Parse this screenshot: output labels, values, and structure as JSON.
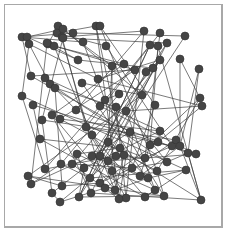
{
  "diagram": {
    "type": "network-graph",
    "frame": {
      "x": 4,
      "y": 4,
      "width": 218,
      "height": 222,
      "border_color": "#a8a8a8"
    },
    "colors": {
      "node": "#454545",
      "edge": "#3a3a3a",
      "background": "#ffffff"
    },
    "node_radius": 4,
    "nodes": [
      [
        22,
        37
      ],
      [
        27,
        37
      ],
      [
        29,
        44
      ],
      [
        58,
        26
      ],
      [
        57,
        33
      ],
      [
        63,
        29
      ],
      [
        62,
        37
      ],
      [
        73,
        33
      ],
      [
        63,
        38
      ],
      [
        48,
        44
      ],
      [
        54,
        46
      ],
      [
        47,
        43
      ],
      [
        96,
        26
      ],
      [
        100,
        26
      ],
      [
        83,
        42
      ],
      [
        106,
        46
      ],
      [
        144,
        31
      ],
      [
        160,
        33
      ],
      [
        185,
        36
      ],
      [
        150,
        45
      ],
      [
        158,
        46
      ],
      [
        167,
        43
      ],
      [
        180,
        59
      ],
      [
        199,
        69
      ],
      [
        78,
        60
      ],
      [
        31,
        76
      ],
      [
        45,
        78
      ],
      [
        50,
        84
      ],
      [
        55,
        88
      ],
      [
        82,
        83
      ],
      [
        98,
        79
      ],
      [
        112,
        66
      ],
      [
        124,
        64
      ],
      [
        135,
        70
      ],
      [
        146,
        72
      ],
      [
        153,
        68
      ],
      [
        142,
        95
      ],
      [
        155,
        105
      ],
      [
        200,
        98
      ],
      [
        202,
        106
      ],
      [
        22,
        96
      ],
      [
        33,
        105
      ],
      [
        42,
        120
      ],
      [
        52,
        115
      ],
      [
        40,
        139
      ],
      [
        60,
        119
      ],
      [
        76,
        110
      ],
      [
        86,
        127
      ],
      [
        105,
        100
      ],
      [
        100,
        106
      ],
      [
        119,
        94
      ],
      [
        116,
        107
      ],
      [
        92,
        135
      ],
      [
        108,
        142
      ],
      [
        120,
        148
      ],
      [
        124,
        155
      ],
      [
        130,
        132
      ],
      [
        150,
        145
      ],
      [
        172,
        146
      ],
      [
        176,
        140
      ],
      [
        188,
        153
      ],
      [
        196,
        154
      ],
      [
        160,
        131
      ],
      [
        158,
        142
      ],
      [
        28,
        176
      ],
      [
        31,
        184
      ],
      [
        45,
        169
      ],
      [
        61,
        164
      ],
      [
        62,
        186
      ],
      [
        52,
        193
      ],
      [
        60,
        202
      ],
      [
        72,
        164
      ],
      [
        77,
        154
      ],
      [
        92,
        156
      ],
      [
        100,
        156
      ],
      [
        108,
        161
      ],
      [
        116,
        156
      ],
      [
        84,
        168
      ],
      [
        90,
        178
      ],
      [
        100,
        183
      ],
      [
        112,
        171
      ],
      [
        132,
        168
      ],
      [
        140,
        176
      ],
      [
        148,
        178
      ],
      [
        155,
        190
      ],
      [
        164,
        196
      ],
      [
        180,
        146
      ],
      [
        186,
        170
      ],
      [
        167,
        162
      ],
      [
        145,
        158
      ],
      [
        126,
        198
      ],
      [
        119,
        199
      ],
      [
        105,
        188
      ],
      [
        91,
        193
      ],
      [
        79,
        197
      ],
      [
        201,
        200
      ],
      [
        157,
        171
      ],
      [
        126,
        111
      ],
      [
        160,
        60
      ],
      [
        115,
        190
      ],
      [
        145,
        197
      ]
    ],
    "edges": [
      [
        0,
        14
      ],
      [
        0,
        25
      ],
      [
        1,
        24
      ],
      [
        2,
        40
      ],
      [
        2,
        30
      ],
      [
        3,
        9
      ],
      [
        3,
        31
      ],
      [
        4,
        15
      ],
      [
        5,
        36
      ],
      [
        6,
        47
      ],
      [
        7,
        18
      ],
      [
        8,
        42
      ],
      [
        9,
        33
      ],
      [
        10,
        52
      ],
      [
        11,
        65
      ],
      [
        12,
        55
      ],
      [
        13,
        37
      ],
      [
        14,
        48
      ],
      [
        15,
        58
      ],
      [
        16,
        46
      ],
      [
        17,
        47
      ],
      [
        18,
        94
      ],
      [
        19,
        49
      ],
      [
        20,
        57
      ],
      [
        21,
        73
      ],
      [
        22,
        86
      ],
      [
        22,
        38
      ],
      [
        23,
        60
      ],
      [
        23,
        86
      ],
      [
        24,
        35
      ],
      [
        25,
        56
      ],
      [
        26,
        62
      ],
      [
        27,
        88
      ],
      [
        28,
        68
      ],
      [
        29,
        84
      ],
      [
        30,
        39
      ],
      [
        31,
        80
      ],
      [
        32,
        43
      ],
      [
        33,
        45
      ],
      [
        34,
        74
      ],
      [
        35,
        71
      ],
      [
        36,
        64
      ],
      [
        37,
        81
      ],
      [
        38,
        57
      ],
      [
        39,
        63
      ],
      [
        40,
        87
      ],
      [
        41,
        61
      ],
      [
        42,
        69
      ],
      [
        43,
        93
      ],
      [
        44,
        54
      ],
      [
        45,
        96
      ],
      [
        46,
        60
      ],
      [
        47,
        90
      ],
      [
        48,
        85
      ],
      [
        49,
        66
      ],
      [
        50,
        67
      ],
      [
        51,
        90
      ],
      [
        52,
        100
      ],
      [
        53,
        95
      ],
      [
        54,
        72
      ],
      [
        55,
        83
      ],
      [
        56,
        91
      ],
      [
        57,
        82
      ],
      [
        58,
        89
      ],
      [
        59,
        92
      ],
      [
        60,
        95
      ],
      [
        61,
        75
      ],
      [
        62,
        77
      ],
      [
        63,
        79
      ],
      [
        64,
        85
      ],
      [
        65,
        73
      ],
      [
        66,
        76
      ],
      [
        67,
        78
      ],
      [
        68,
        79
      ],
      [
        69,
        70
      ],
      [
        70,
        92
      ],
      [
        71,
        91
      ],
      [
        72,
        93
      ],
      [
        73,
        82
      ],
      [
        74,
        99
      ],
      [
        75,
        83
      ],
      [
        76,
        89
      ],
      [
        77,
        94
      ],
      [
        78,
        98
      ],
      [
        79,
        99
      ],
      [
        80,
        84
      ],
      [
        81,
        88
      ],
      [
        82,
        86
      ],
      [
        83,
        87
      ],
      [
        84,
        97
      ],
      [
        85,
        96
      ],
      [
        86,
        95
      ],
      [
        87,
        100
      ],
      [
        88,
        97
      ],
      [
        89,
        17
      ],
      [
        90,
        16
      ],
      [
        91,
        12
      ],
      [
        92,
        3
      ],
      [
        93,
        21
      ],
      [
        94,
        19
      ],
      [
        95,
        20
      ],
      [
        96,
        13
      ],
      [
        97,
        98
      ],
      [
        98,
        34
      ],
      [
        99,
        43
      ],
      [
        100,
        44
      ],
      [
        0,
        7
      ],
      [
        1,
        5
      ],
      [
        4,
        12
      ],
      [
        6,
        16
      ],
      [
        8,
        21
      ],
      [
        10,
        32
      ],
      [
        11,
        24
      ],
      [
        2,
        27
      ],
      [
        25,
        33
      ],
      [
        26,
        46
      ],
      [
        28,
        51
      ],
      [
        29,
        36
      ],
      [
        30,
        98
      ],
      [
        31,
        53
      ],
      [
        40,
        66
      ],
      [
        41,
        44
      ],
      [
        42,
        59
      ],
      [
        45,
        62
      ],
      [
        47,
        58
      ],
      [
        48,
        50
      ],
      [
        49,
        61
      ],
      [
        52,
        75
      ],
      [
        54,
        89
      ],
      [
        56,
        73
      ],
      [
        57,
        63
      ],
      [
        58,
        86
      ],
      [
        64,
        68
      ],
      [
        65,
        67
      ],
      [
        69,
        77
      ],
      [
        70,
        76
      ],
      [
        71,
        81
      ],
      [
        72,
        80
      ],
      [
        74,
        97
      ],
      [
        78,
        87
      ],
      [
        79,
        81
      ],
      [
        83,
        99
      ],
      [
        85,
        94
      ],
      [
        88,
        60
      ],
      [
        90,
        92
      ],
      [
        91,
        80
      ],
      [
        93,
        95
      ],
      [
        94,
        19
      ],
      [
        96,
        38
      ],
      [
        97,
        39
      ],
      [
        99,
        55
      ],
      [
        100,
        84
      ]
    ]
  }
}
